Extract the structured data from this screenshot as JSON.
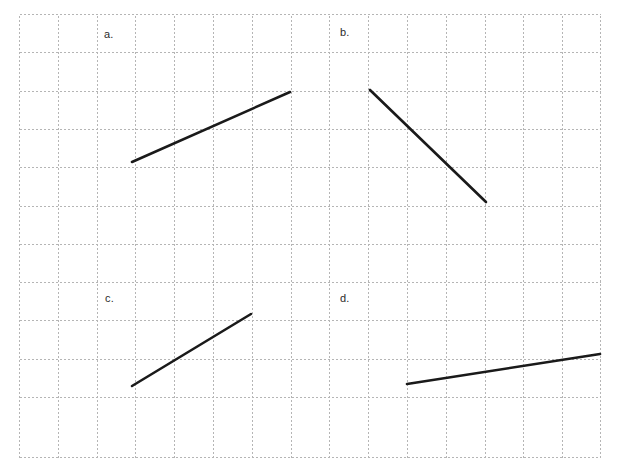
{
  "figure": {
    "title": "",
    "background_color": "#ffffff",
    "grid": {
      "style": "dotted",
      "color": "#b5b5b5",
      "cell_size_px": 38.8,
      "origin_x_px": 19,
      "origin_y_px": 14,
      "columns": 15,
      "rows": 11,
      "x_lines": [
        19,
        57.8,
        96.6,
        135.4,
        174.2,
        213,
        251.8,
        290.6,
        329.4,
        368.2,
        407,
        445.8,
        484.6,
        523.4,
        562.2,
        601
      ],
      "y_lines": [
        14,
        52.3,
        90.6,
        128.9,
        167.2,
        205.5,
        243.8,
        282.1,
        320.4,
        358.7,
        397,
        435.3,
        457
      ],
      "visible": true
    }
  },
  "chart_data": {
    "type": "line",
    "title": "",
    "xlabel": "",
    "ylabel": "",
    "grid": true,
    "legend_position": "none",
    "panels": [
      {
        "label": "a.",
        "label_position_px": [
          104,
          29
        ],
        "segment": {
          "name": "segment-a",
          "x1_px": 132,
          "y1_px": 162,
          "x2_px": 290,
          "y2_px": 92,
          "color": "#1a1a1a",
          "thickness_px": 2.6,
          "direction": "rising",
          "rise_cells": 2,
          "run_cells": 4,
          "slope": 0.5
        }
      },
      {
        "label": "b.",
        "label_position_px": [
          340,
          27
        ],
        "segment": {
          "name": "segment-b",
          "x1_px": 370,
          "y1_px": 90,
          "x2_px": 486,
          "y2_px": 202,
          "color": "#1a1a1a",
          "thickness_px": 2.6,
          "direction": "falling",
          "rise_cells": -3,
          "run_cells": 3,
          "slope": -1
        }
      },
      {
        "label": "c.",
        "label_position_px": [
          105,
          293
        ],
        "segment": {
          "name": "segment-c",
          "x1_px": 132,
          "y1_px": 386,
          "x2_px": 251,
          "y2_px": 314,
          "color": "#1a1a1a",
          "thickness_px": 2.6,
          "direction": "rising",
          "rise_cells": 2,
          "run_cells": 3,
          "slope": 0.667
        }
      },
      {
        "label": "d.",
        "label_position_px": [
          340,
          293
        ],
        "segment": {
          "name": "segment-d",
          "x1_px": 407,
          "y1_px": 384,
          "x2_px": 600,
          "y2_px": 354,
          "color": "#1a1a1a",
          "thickness_px": 2.6,
          "direction": "rising",
          "rise_cells": 0.8,
          "run_cells": 5,
          "slope": 0.155
        }
      }
    ]
  },
  "labels": {
    "a": "a.",
    "b": "b.",
    "c": "c.",
    "d": "d."
  },
  "colors": {
    "grid": "#b5b5b5",
    "segment": "#1a1a1a",
    "label_text": "#2b2b2b",
    "background": "#ffffff"
  }
}
